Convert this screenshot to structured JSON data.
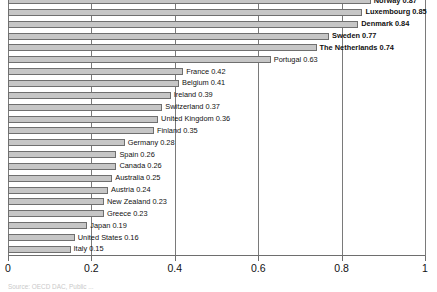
{
  "chart_data": {
    "type": "bar",
    "orientation": "horizontal",
    "title": "",
    "subtitle": "",
    "xlabel": "",
    "ylabel": "",
    "xlim": [
      0,
      1
    ],
    "grid": true,
    "legend": null,
    "xticks": [
      "0",
      "0.2",
      "0.4",
      "0.6",
      "0.8",
      "1"
    ],
    "xtick_values": [
      0,
      0.2,
      0.4,
      0.6,
      0.8,
      1
    ],
    "categories": [
      "Norway",
      "Luxembourg",
      "Denmark",
      "Sweden",
      "The Netherlands",
      "Portugal",
      "France",
      "Belgium",
      "Ireland",
      "Switzerland",
      "United Kingdom",
      "Finland",
      "Germany",
      "Spain",
      "Canada",
      "Australia",
      "Austria",
      "New Zealand",
      "Greece",
      "Japan",
      "United States",
      "Italy"
    ],
    "values": [
      0.87,
      0.85,
      0.84,
      0.77,
      0.74,
      0.63,
      0.42,
      0.41,
      0.39,
      0.37,
      0.36,
      0.35,
      0.28,
      0.26,
      0.26,
      0.25,
      0.24,
      0.23,
      0.23,
      0.19,
      0.16,
      0.15
    ],
    "bars": [
      {
        "label": "Norway 0.87",
        "category": "Norway",
        "value": 0.87,
        "emphasis": true
      },
      {
        "label": "Luxembourg 0.85",
        "category": "Luxembourg",
        "value": 0.85,
        "emphasis": true
      },
      {
        "label": "Denmark 0.84",
        "category": "Denmark",
        "value": 0.84,
        "emphasis": true
      },
      {
        "label": "Sweden 0.77",
        "category": "Sweden",
        "value": 0.77,
        "emphasis": true
      },
      {
        "label": "The Netherlands 0.74",
        "category": "The Netherlands",
        "value": 0.74,
        "emphasis": true
      },
      {
        "label": "Portugal 0.63",
        "category": "Portugal",
        "value": 0.63,
        "emphasis": false
      },
      {
        "label": "France 0.42",
        "category": "France",
        "value": 0.42,
        "emphasis": false
      },
      {
        "label": "Belgium 0.41",
        "category": "Belgium",
        "value": 0.41,
        "emphasis": false
      },
      {
        "label": "Ireland 0.39",
        "category": "Ireland",
        "value": 0.39,
        "emphasis": false
      },
      {
        "label": "Switzerland 0.37",
        "category": "Switzerland",
        "value": 0.37,
        "emphasis": false
      },
      {
        "label": "United Kingdom 0.36",
        "category": "United Kingdom",
        "value": 0.36,
        "emphasis": false
      },
      {
        "label": "Finland 0.35",
        "category": "Finland",
        "value": 0.35,
        "emphasis": false
      },
      {
        "label": "Germany 0.28",
        "category": "Germany",
        "value": 0.28,
        "emphasis": false
      },
      {
        "label": "Spain 0.26",
        "category": "Spain",
        "value": 0.26,
        "emphasis": false
      },
      {
        "label": "Canada 0.26",
        "category": "Canada",
        "value": 0.26,
        "emphasis": false
      },
      {
        "label": "Australia 0.25",
        "category": "Australia",
        "value": 0.25,
        "emphasis": false
      },
      {
        "label": "Austria 0.24",
        "category": "Austria",
        "value": 0.24,
        "emphasis": false
      },
      {
        "label": "New Zealand 0.23",
        "category": "New Zealand",
        "value": 0.23,
        "emphasis": false
      },
      {
        "label": "Greece 0.23",
        "category": "Greece",
        "value": 0.23,
        "emphasis": false
      },
      {
        "label": "Japan 0.19",
        "category": "Japan",
        "value": 0.19,
        "emphasis": false
      },
      {
        "label": "United States 0.16",
        "category": "United States",
        "value": 0.16,
        "emphasis": false
      },
      {
        "label": "Italy 0.15",
        "category": "Italy",
        "value": 0.15,
        "emphasis": false
      }
    ],
    "colors": {
      "bar_fill": "#c6c6c6",
      "bar_border": "#6f6f6f",
      "gridline": "#7a7a7a",
      "axis": "#6e6e6e",
      "text": "#111111"
    }
  },
  "footer": {
    "source_note": "Source: OECD DAC, Public ..."
  },
  "geometry": {
    "plot_left_px": 8,
    "plot_right_px": 425,
    "row_height_px": 11.85,
    "first_row_top_px": -5
  }
}
